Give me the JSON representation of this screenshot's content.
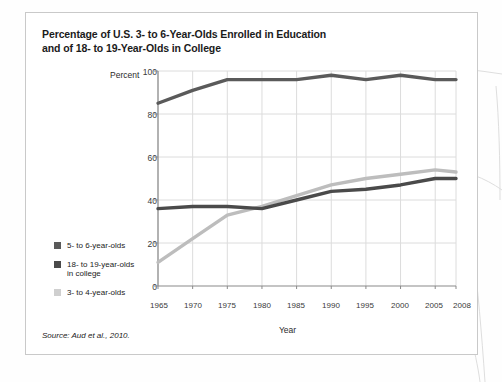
{
  "card": {
    "title_line1": "Percentage of U.S. 3- to 6-Year-Olds Enrolled in Education",
    "title_line2": "and of 18- to 19-Year-Olds in College",
    "source": "Source: Aud et al., 2010."
  },
  "chart_data": {
    "type": "line",
    "title": "Percentage of U.S. 3- to 6-Year-Olds Enrolled in Education and of 18- to 19-Year-Olds in College",
    "xlabel": "Year",
    "ylabel": "Percent",
    "xlim": [
      1965,
      2008
    ],
    "ylim": [
      0,
      100
    ],
    "grid": true,
    "legend_position": "left-bottom",
    "xticks": [
      "1965",
      "1970",
      "1975",
      "1980",
      "1985",
      "1990",
      "1995",
      "2000",
      "2005",
      "2008"
    ],
    "xtick_values": [
      1965,
      1970,
      1975,
      1980,
      1985,
      1990,
      1995,
      2000,
      2005,
      2008
    ],
    "yticks": [
      "0",
      "20",
      "40",
      "60",
      "80",
      "100"
    ],
    "ytick_values": [
      0,
      20,
      40,
      60,
      80,
      100
    ],
    "x": [
      1965,
      1970,
      1975,
      1980,
      1985,
      1990,
      1995,
      2000,
      2005,
      2008
    ],
    "series": [
      {
        "name": "5- to 6-year-olds",
        "color": "#5a5a5a",
        "values": [
          85,
          91,
          96,
          96,
          96,
          98,
          96,
          98,
          96,
          96
        ]
      },
      {
        "name": "18- to 19-year-olds\nin college",
        "color": "#4a4a4a",
        "values": [
          36,
          37,
          37,
          36,
          40,
          44,
          45,
          47,
          50,
          50
        ]
      },
      {
        "name": "3- to 4-year-olds",
        "color": "#bdbdbd",
        "values": [
          11,
          22,
          33,
          37,
          42,
          47,
          50,
          52,
          54,
          53
        ]
      }
    ]
  },
  "legend": {
    "items": [
      {
        "label": "5- to 6-year-olds",
        "color": "#5a5a5a"
      },
      {
        "label": "18- to 19-year-olds\nin college",
        "color": "#4a4a4a"
      },
      {
        "label": "3- to 4-year-olds",
        "color": "#cfcfcf"
      }
    ]
  },
  "colors": {
    "frame": "#c9c9c9",
    "grid": "#dcdcdc",
    "axis": "#8a8a8a",
    "text": "#1b1b1b"
  }
}
